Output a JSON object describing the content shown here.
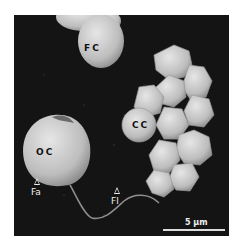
{
  "figure": {
    "type": "scanning electron micrograph",
    "labels": {
      "fc": "FC",
      "cc": "CC",
      "oc": "OC",
      "fa": "Fa",
      "fl": "Fl"
    },
    "scale_bar": {
      "label": "5 μm",
      "value": 5,
      "unit": "μm"
    },
    "colors": {
      "background": "#141414",
      "cell": "#cfcfcf",
      "frame": "#ffffff"
    }
  }
}
